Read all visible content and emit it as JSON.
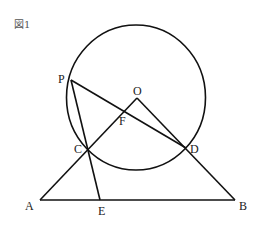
{
  "figure": {
    "title": "図1",
    "circle": {
      "center_label": "O"
    },
    "points": {
      "P": "P",
      "O": "O",
      "F": "F",
      "C": "C",
      "D": "D",
      "A": "A",
      "E": "E",
      "B": "B"
    },
    "segments": [
      "PD",
      "PE",
      "OA",
      "OB",
      "AB"
    ]
  }
}
